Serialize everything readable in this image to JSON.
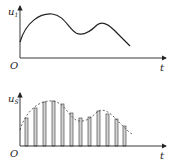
{
  "top_plot": {
    "y_label": "u",
    "y_sub": "1",
    "x_label": "t",
    "origin": "O"
  },
  "bottom_plot": {
    "y_label": "u",
    "y_sub": "S",
    "x_label": "t",
    "origin": "O"
  },
  "colors": {
    "line": "#222222",
    "bar_fill": "#cfcfcf",
    "dashed": "#555555"
  }
}
